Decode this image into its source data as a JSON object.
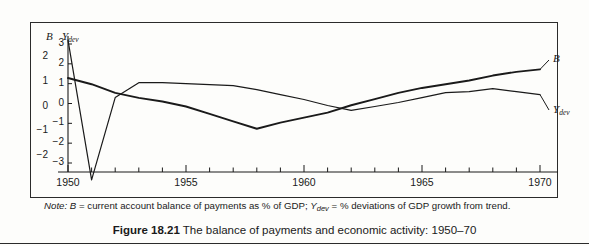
{
  "figure": {
    "caption_label": "Figure 18.21",
    "caption_text": "The balance of payments and economic activity: 1950–70",
    "note_prefix": "Note:",
    "note_body_a": "B = current account balance of payments as % of GDP; ",
    "note_body_b": "Y",
    "note_body_b_sub": "dev",
    "note_body_c": " = % deviations of GDP growth from trend."
  },
  "chart_data": {
    "type": "line",
    "title": "The balance of payments and economic activity: 1950–70",
    "xlabel": "",
    "ylabel": "B",
    "y2label": "Y_dev",
    "grid": false,
    "legend_position": "right-inline",
    "xlim": [
      1950,
      1970
    ],
    "ylim": [
      -2.6,
      2.4
    ],
    "y2lim": [
      -3.9,
      3.6
    ],
    "xticks": [
      1950,
      1951,
      1952,
      1953,
      1954,
      1955,
      1956,
      1957,
      1958,
      1959,
      1960,
      1961,
      1962,
      1963,
      1964,
      1965,
      1966,
      1967,
      1968,
      1969,
      1970
    ],
    "xticklabels": [
      "1950",
      "",
      "",
      "",
      "",
      "1955",
      "",
      "",
      "",
      "",
      "1960",
      "",
      "",
      "",
      "",
      "1965",
      "",
      "",
      "",
      "",
      "1970"
    ],
    "yticks": [
      2,
      1,
      0,
      -1,
      -2
    ],
    "yticklabels": [
      "2",
      "1",
      "0",
      "−1",
      "−2"
    ],
    "y2ticks": [
      3,
      2,
      1,
      0,
      -1,
      -2,
      -3
    ],
    "y2ticklabels": [
      "3",
      "2",
      "1",
      "0",
      "−1",
      "−2",
      "−3"
    ],
    "x": [
      1950,
      1951,
      1952,
      1953,
      1954,
      1955,
      1956,
      1957,
      1958,
      1959,
      1960,
      1961,
      1962,
      1963,
      1964,
      1965,
      1966,
      1967,
      1968,
      1969,
      1970
    ],
    "series": [
      {
        "name": "B",
        "axis": "left",
        "label": "B",
        "values": [
          1.15,
          0.9,
          0.55,
          0.35,
          0.2,
          0.0,
          -0.3,
          -0.6,
          -0.9,
          -0.65,
          -0.45,
          -0.25,
          0.05,
          0.3,
          0.55,
          0.75,
          0.9,
          1.05,
          1.25,
          1.4,
          1.5
        ]
      },
      {
        "name": "Y_dev",
        "axis": "right",
        "label": "Y",
        "label_sub": "dev",
        "values": [
          3.2,
          -3.85,
          0.3,
          1.05,
          1.05,
          1.0,
          0.95,
          0.9,
          0.7,
          0.45,
          0.2,
          -0.1,
          -0.35,
          -0.15,
          0.05,
          0.3,
          0.55,
          0.6,
          0.75,
          0.6,
          0.45
        ]
      }
    ]
  },
  "axes": {
    "left_axis_name": "B",
    "right_axis_name": "Y",
    "right_axis_sub": "dev"
  }
}
